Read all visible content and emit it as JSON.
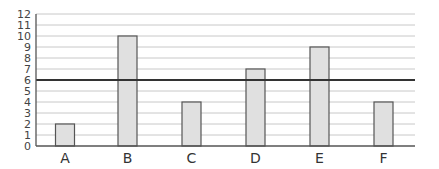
{
  "chart_data": {
    "type": "bar",
    "title": "",
    "xlabel": "",
    "ylabel": "",
    "categories": [
      "A",
      "B",
      "C",
      "D",
      "E",
      "F"
    ],
    "values": [
      2,
      10,
      4,
      7,
      9,
      4
    ],
    "ylim": [
      0,
      12
    ],
    "yticks": [
      0,
      1,
      2,
      3,
      4,
      5,
      6,
      7,
      8,
      9,
      10,
      11,
      12
    ],
    "grid": true,
    "legend": null,
    "reference_line": {
      "y": 6,
      "color": "#333333"
    },
    "colors": {
      "bar_fill": "#e0e0e0",
      "bar_stroke": "#555555",
      "grid": "#c8c8c8",
      "axis": "#555555"
    }
  }
}
